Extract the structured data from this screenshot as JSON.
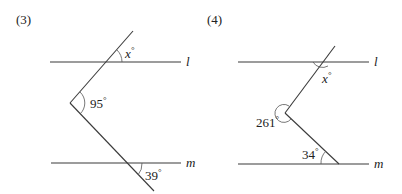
{
  "figures": [
    {
      "label": "(3)",
      "line_labels": {
        "top": "l",
        "bottom": "m"
      },
      "angles": [
        {
          "name": "x",
          "text": "x",
          "degree_mark": "°"
        },
        {
          "name": "vertex_angle",
          "text": "95",
          "degree_mark": "°"
        },
        {
          "name": "bottom_angle",
          "text": "39",
          "degree_mark": "°"
        }
      ]
    },
    {
      "label": "(4)",
      "line_labels": {
        "top": "l",
        "bottom": "m"
      },
      "angles": [
        {
          "name": "x",
          "text": "x",
          "degree_mark": "°"
        },
        {
          "name": "reflex_angle",
          "text": "261",
          "degree_mark": "°"
        },
        {
          "name": "bottom_angle",
          "text": "34",
          "degree_mark": "°"
        }
      ]
    }
  ]
}
